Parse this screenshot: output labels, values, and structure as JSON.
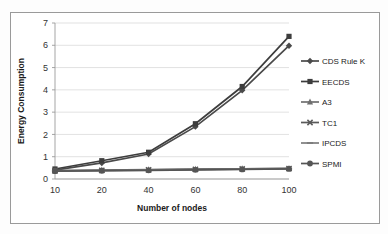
{
  "chart_data": {
    "type": "line",
    "title": "",
    "xlabel": "Number of nodes",
    "ylabel": "Energy Consumption",
    "categories": [
      10,
      20,
      40,
      60,
      80,
      100
    ],
    "xtick_labels": [
      "10",
      "20",
      "40",
      "60",
      "80",
      "100"
    ],
    "ytick_labels": [
      "0",
      "1",
      "2",
      "3",
      "4",
      "5",
      "6",
      "7"
    ],
    "ylim": [
      0,
      7
    ],
    "ytick_step": 1,
    "grid": "horizontal",
    "legend_position": "right",
    "series": [
      {
        "name": "CDS Rule K",
        "marker": "diamond",
        "color": "#4a4a4a",
        "values": [
          0.4,
          0.72,
          1.12,
          2.35,
          3.98,
          5.98
        ]
      },
      {
        "name": "EECDS",
        "marker": "square",
        "color": "#3d3d3d",
        "values": [
          0.45,
          0.82,
          1.2,
          2.48,
          4.15,
          6.4
        ]
      },
      {
        "name": "A3",
        "marker": "triangle",
        "color": "#6f6f6f",
        "values": [
          0.38,
          0.4,
          0.42,
          0.44,
          0.46,
          0.48
        ]
      },
      {
        "name": "TC1",
        "marker": "cross",
        "color": "#5a5a5a",
        "values": [
          0.37,
          0.39,
          0.41,
          0.43,
          0.45,
          0.47
        ]
      },
      {
        "name": "IPCDS",
        "marker": "dash",
        "color": "#7d7d7d",
        "values": [
          0.36,
          0.38,
          0.4,
          0.42,
          0.44,
          0.46
        ]
      },
      {
        "name": "SPMI",
        "marker": "circle",
        "color": "#555555",
        "values": [
          0.35,
          0.37,
          0.39,
          0.41,
          0.43,
          0.45
        ]
      }
    ]
  },
  "colors": {
    "grid": "#d4d4d4",
    "axis": "#9b9b9b",
    "border": "#9a9a9a",
    "text": "#1a1a1a",
    "background": "#ffffff"
  }
}
